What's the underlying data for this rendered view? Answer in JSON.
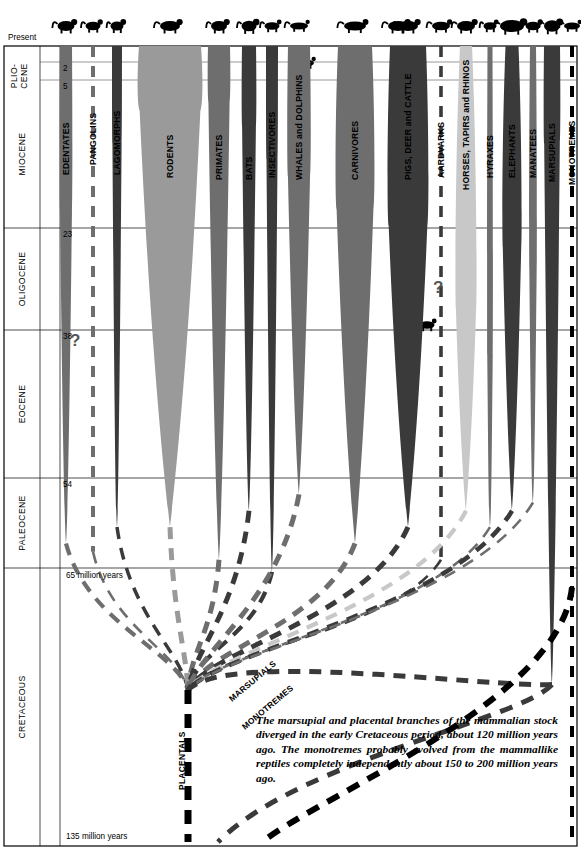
{
  "axis": {
    "present_label": "Present",
    "unit_note_top": "65 million years",
    "unit_note_bottom": "135 million years",
    "tick_values": [
      "2",
      "5",
      "23",
      "38",
      "54"
    ],
    "epochs": [
      {
        "name": "PLIO-\nCENE",
        "label": "PLIO-CENE",
        "from": 0,
        "to": 5
      },
      {
        "name": "MIOCENE",
        "label": "MIOCENE",
        "from": 5,
        "to": 23
      },
      {
        "name": "OLIGOCENE",
        "label": "OLIGOCENE",
        "from": 23,
        "to": 38
      },
      {
        "name": "EOCENE",
        "label": "EOCENE",
        "from": 38,
        "to": 54
      },
      {
        "name": "PALEOCENE",
        "label": "PALEOCENE",
        "from": 54,
        "to": 65
      },
      {
        "name": "CRETACEOUS",
        "label": "CRETACEOUS",
        "from": 65,
        "to": 135
      }
    ]
  },
  "caption": "The marsupial and placental branches of the mammalian stock diverged in the early Cretaceous period, about 120 million years ago. The monotremes probably evolved from the mammallike reptiles completely independently about 150 to 200 million years ago.",
  "branch_labels": [
    {
      "label": "PLACENTALS"
    },
    {
      "label": "MARSUPIALS"
    },
    {
      "label": "MONOTREMES"
    }
  ],
  "uncertainty_markers": [
    "?",
    "?"
  ],
  "colors": {
    "background": "#ffffff",
    "ink": "#000000",
    "gray_dark": "#3a3a3a",
    "gray_mid": "#6e6e6e",
    "gray_light": "#9a9a9a",
    "gray_pale": "#c8c8c8"
  },
  "chart_data": {
    "type": "area",
    "xlabel": "",
    "ylabel": "Millions of years before present",
    "ylim": [
      0,
      135
    ],
    "grid": true,
    "legend": "none",
    "groups": [
      {
        "name": "EDENTATES",
        "icon": "sloth-icon",
        "shade": "gray_mid",
        "origin_mya": 62,
        "peak_mya": 20,
        "present_width": 12,
        "peak_width": 13,
        "style": "solid"
      },
      {
        "name": "PANGOLINS",
        "icon": "pangolin-icon",
        "shade": "gray_mid",
        "origin_mya": 63,
        "peak_mya": 0,
        "present_width": 3,
        "peak_width": 3,
        "style": "dashed"
      },
      {
        "name": "LAGOMORPHS",
        "icon": "rabbit-icon",
        "shade": "gray_dark",
        "origin_mya": 60,
        "peak_mya": 10,
        "present_width": 8,
        "peak_width": 9,
        "style": "solid"
      },
      {
        "name": "RODENTS",
        "icon": "rat-icon",
        "shade": "gray_light",
        "origin_mya": 60,
        "peak_mya": 6,
        "present_width": 62,
        "peak_width": 66,
        "style": "solid"
      },
      {
        "name": "PRIMATES",
        "icon": "monkey-icon",
        "shade": "gray_mid",
        "origin_mya": 64,
        "peak_mya": 5,
        "present_width": 22,
        "peak_width": 23,
        "style": "solid"
      },
      {
        "name": "BATS",
        "icon": "bat-icon",
        "shade": "gray_dark",
        "origin_mya": 58,
        "peak_mya": 8,
        "present_width": 15,
        "peak_width": 16,
        "style": "solid"
      },
      {
        "name": "INSECTIVORES",
        "icon": "shrew-icon",
        "shade": "gray_dark",
        "origin_mya": 66,
        "peak_mya": 12,
        "present_width": 11,
        "peak_width": 12,
        "style": "solid"
      },
      {
        "name": "WHALES and DOLPHINS",
        "icon": "dolphin-icon",
        "shade": "gray_mid",
        "origin_mya": 56,
        "peak_mya": 14,
        "present_width": 22,
        "peak_width": 24,
        "style": "solid"
      },
      {
        "name": "CARNIVORES",
        "icon": "fox-icon",
        "shade": "gray_mid",
        "origin_mya": 62,
        "peak_mya": 18,
        "present_width": 34,
        "peak_width": 40,
        "style": "solid"
      },
      {
        "name": "PIGS, DEER and CATTLE",
        "icon": "deer-icon",
        "shade": "gray_dark",
        "origin_mya": 60,
        "peak_mya": 20,
        "present_width": 36,
        "peak_width": 42,
        "style": "solid"
      },
      {
        "name": "AARDVARKS",
        "icon": "aardvark-icon",
        "shade": "gray_dark",
        "origin_mya": 64,
        "peak_mya": 0,
        "present_width": 3,
        "peak_width": 3,
        "style": "dashed"
      },
      {
        "name": "HORSES, TAPIRS and RHINOS",
        "icon": "zebra-icon",
        "shade": "gray_pale",
        "origin_mya": 58,
        "peak_mya": 30,
        "present_width": 12,
        "peak_width": 22,
        "style": "solid"
      },
      {
        "name": "HYRAXES",
        "icon": "hyrax-icon",
        "shade": "gray_mid",
        "origin_mya": 60,
        "peak_mya": 40,
        "present_width": 5,
        "peak_width": 6,
        "style": "solid"
      },
      {
        "name": "ELEPHANTS",
        "icon": "elephant-icon",
        "shade": "gray_dark",
        "origin_mya": 58,
        "peak_mya": 22,
        "present_width": 13,
        "peak_width": 20,
        "style": "solid"
      },
      {
        "name": "MANATEES",
        "icon": "manatee-icon",
        "shade": "gray_mid",
        "origin_mya": 57,
        "peak_mya": 25,
        "present_width": 6,
        "peak_width": 8,
        "style": "solid"
      },
      {
        "name": "MARSUPIALS",
        "icon": "kangaroo-icon",
        "shade": "gray_dark",
        "origin_mya": 95,
        "peak_mya": 10,
        "present_width": 16,
        "peak_width": 17,
        "style": "solid"
      },
      {
        "name": "MONOTREMES",
        "icon": "platypus-icon",
        "shade": "ink",
        "origin_mya": 135,
        "peak_mya": 0,
        "present_width": 4,
        "peak_width": 4,
        "style": "dashed"
      }
    ]
  }
}
